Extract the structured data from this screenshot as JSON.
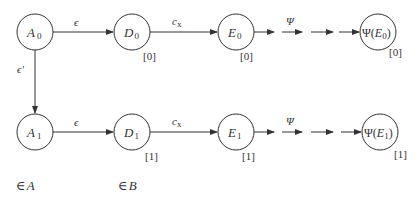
{
  "diagram": {
    "rows": [
      {
        "nodes": [
          {
            "id": "A0",
            "base": "A",
            "sub": "0",
            "index": ""
          },
          {
            "id": "D0",
            "base": "D",
            "sub": "0",
            "index": "[0]"
          },
          {
            "id": "E0",
            "base": "E",
            "sub": "0",
            "index": "[0]"
          },
          {
            "id": "PsiE0",
            "prefix": "Ψ(",
            "base": "E",
            "sub": "0",
            "suffix": ")",
            "index": "[0]"
          }
        ],
        "edges": [
          {
            "from": "A0",
            "to": "D0",
            "label": "ϵ"
          },
          {
            "from": "D0",
            "to": "E0",
            "label": "c",
            "label_sub": "x"
          },
          {
            "from": "E0",
            "to": "PsiE0",
            "label": "Ψ",
            "style": "dashed-arrows"
          }
        ]
      },
      {
        "nodes": [
          {
            "id": "A1",
            "base": "A",
            "sub": "1",
            "index": ""
          },
          {
            "id": "D1",
            "base": "D",
            "sub": "1",
            "index": "[1]"
          },
          {
            "id": "E1",
            "base": "E",
            "sub": "1",
            "index": "[1]"
          },
          {
            "id": "PsiE1",
            "prefix": "Ψ(",
            "base": "E",
            "sub": "1",
            "suffix": ")",
            "index": "[1]"
          }
        ],
        "edges": [
          {
            "from": "A1",
            "to": "D1",
            "label": "ϵ"
          },
          {
            "from": "D1",
            "to": "E1",
            "label": "c",
            "label_sub": "x"
          },
          {
            "from": "E1",
            "to": "PsiE1",
            "label": "Ψ",
            "style": "dashed-arrows"
          }
        ]
      }
    ],
    "vertical_edge": {
      "from": "A0",
      "to": "A1",
      "label": "ϵ′"
    },
    "column_labels": [
      {
        "symbol": "∈",
        "set": "A"
      },
      {
        "symbol": "∈",
        "set": "B"
      }
    ]
  }
}
